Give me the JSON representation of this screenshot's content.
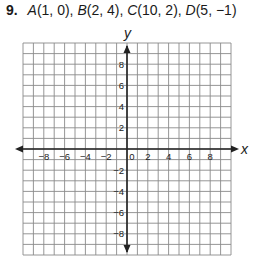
{
  "problem": {
    "number": "9.",
    "points": [
      {
        "label": "A",
        "coords": "(1, 0)",
        "sep": ", "
      },
      {
        "label": "B",
        "coords": "(2, 4)",
        "sep": ", "
      },
      {
        "label": "C",
        "coords": "(10, 2)",
        "sep": ", "
      },
      {
        "label": "D",
        "coords": "(5, −1)",
        "sep": ""
      }
    ]
  },
  "chart_data": {
    "type": "scatter",
    "title": "",
    "xlabel": "x",
    "ylabel": "y",
    "xlim": [
      -10,
      10
    ],
    "ylim": [
      -10,
      10
    ],
    "grid": true,
    "grid_step": 1,
    "x_tick_labels": [
      "-8",
      "-6",
      "-4",
      "-2",
      "0",
      "2",
      "4",
      "6",
      "8"
    ],
    "y_tick_labels": [
      "8",
      "6",
      "4",
      "2",
      "-2",
      "-4",
      "-6",
      "-8"
    ],
    "points_listed": [
      {
        "name": "A",
        "x": 1,
        "y": 0
      },
      {
        "name": "B",
        "x": 2,
        "y": 4
      },
      {
        "name": "C",
        "x": 10,
        "y": 2
      },
      {
        "name": "D",
        "x": 5,
        "y": -1
      }
    ],
    "points_plotted": []
  }
}
